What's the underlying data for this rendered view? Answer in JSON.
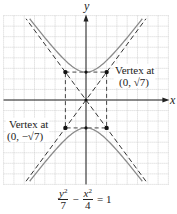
{
  "diagram": {
    "type": "hyperbola-graph",
    "equation": {
      "term1": {
        "numerator_var": "y",
        "numerator_exp": "2",
        "denominator": "7"
      },
      "operator": "−",
      "term2": {
        "numerator_var": "x",
        "numerator_exp": "2",
        "denominator": "4"
      },
      "equals": "= 1"
    },
    "axes": {
      "x_label": "x",
      "y_label": "y",
      "x_range": [
        -8,
        8
      ],
      "y_range": [
        -8,
        8
      ],
      "grid": true,
      "grid_step": 1
    },
    "hyperbola": {
      "a_squared": 7,
      "b_squared": 4,
      "orientation": "vertical"
    },
    "asymptotes": [
      {
        "slope_expr": "√7/2",
        "slope": 1.3229
      },
      {
        "slope_expr": "−√7/2",
        "slope": -1.3229
      }
    ],
    "rectangle_corners": [
      [
        -2,
        2.6458
      ],
      [
        2,
        2.6458
      ],
      [
        2,
        -2.6458
      ],
      [
        -2,
        -2.6458
      ]
    ],
    "vertices": [
      [
        0,
        2.6458
      ],
      [
        0,
        -2.6458
      ]
    ],
    "center": [
      0,
      0
    ],
    "annotations": [
      {
        "line1": "Vertex at",
        "line2": "(0, √7)"
      },
      {
        "line1": "Vertex at",
        "line2": "(0, −√7)"
      }
    ],
    "colors": {
      "curve": "#8a8a8a",
      "asymptote": "#333333",
      "grid": "#c8c8c8",
      "axis": "#222222",
      "point": "#111111"
    }
  }
}
